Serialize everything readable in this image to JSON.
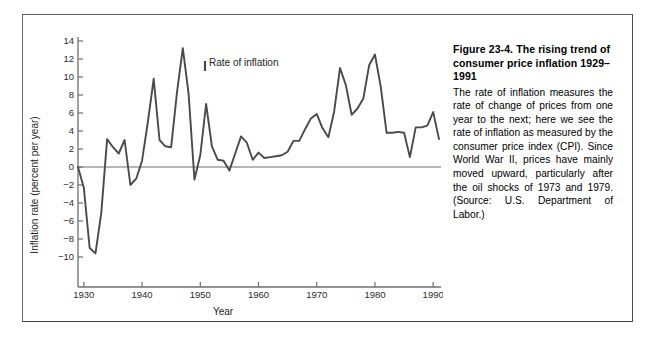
{
  "figure": {
    "caption_title": "Figure 23-4.  The rising trend of consumer price inflation 1929–1991",
    "caption_body": "The rate of inflation measures the rate of change of prices from one year to the next; here we see the rate of inflation as measured by the consumer price index (CPI). Since World War II, prices have mainly moved upward, particularly after the oil shocks of 1973 and 1979. (Source:  U.S. Department of Labor.)"
  },
  "colors": {
    "line": "#4a4a4a",
    "axis": "#6e6e6e",
    "frame": "#5a5a5a",
    "text": "#1d1d1d",
    "background": "#ffffff"
  },
  "chart_data": {
    "type": "line",
    "title": "",
    "xlabel": "Year",
    "ylabel": "Inflation rate (percent per year)",
    "annotation": "Rate of inflation",
    "xlim": [
      1929,
      1991
    ],
    "ylim": [
      -11,
      14
    ],
    "grid": false,
    "legend": "none",
    "xticks": [
      1930,
      1940,
      1950,
      1960,
      1970,
      1980,
      1990
    ],
    "xtick_labels": [
      "1930",
      "1940",
      "1950",
      "1960",
      "1970",
      "1980",
      "1990"
    ],
    "yticks": [
      -10,
      -8,
      -6,
      -4,
      -2,
      0,
      2,
      4,
      6,
      8,
      10,
      12,
      14
    ],
    "ytick_labels": [
      "−10",
      "−8",
      "−6",
      "−4",
      "−2",
      "0",
      "2",
      "4",
      "6",
      "8",
      "10",
      "12",
      "14"
    ],
    "zero_line": 0,
    "series": [
      {
        "name": "Rate of inflation",
        "x": [
          1929,
          1930,
          1931,
          1932,
          1933,
          1934,
          1935,
          1936,
          1937,
          1938,
          1939,
          1940,
          1941,
          1942,
          1943,
          1944,
          1945,
          1946,
          1947,
          1948,
          1949,
          1950,
          1951,
          1952,
          1953,
          1954,
          1955,
          1956,
          1957,
          1958,
          1959,
          1960,
          1961,
          1962,
          1963,
          1964,
          1965,
          1966,
          1967,
          1968,
          1969,
          1970,
          1971,
          1972,
          1973,
          1974,
          1975,
          1976,
          1977,
          1978,
          1979,
          1980,
          1981,
          1982,
          1983,
          1984,
          1985,
          1986,
          1987,
          1988,
          1989,
          1990,
          1991
        ],
        "values": [
          0.0,
          -2.3,
          -9.0,
          -9.6,
          -5.1,
          3.1,
          2.2,
          1.5,
          3.0,
          -2.0,
          -1.3,
          0.7,
          5.0,
          9.8,
          3.0,
          2.3,
          2.2,
          8.3,
          13.2,
          8.1,
          -1.4,
          1.3,
          7.0,
          2.3,
          0.8,
          0.7,
          -0.4,
          1.5,
          3.4,
          2.7,
          0.8,
          1.6,
          1.0,
          1.1,
          1.2,
          1.3,
          1.7,
          2.9,
          2.9,
          4.2,
          5.4,
          5.9,
          4.3,
          3.3,
          6.2,
          11.0,
          9.1,
          5.8,
          6.5,
          7.6,
          11.3,
          12.5,
          8.9,
          3.8,
          3.8,
          3.9,
          3.8,
          1.1,
          4.4,
          4.4,
          4.6,
          6.1,
          3.1
        ]
      }
    ]
  }
}
